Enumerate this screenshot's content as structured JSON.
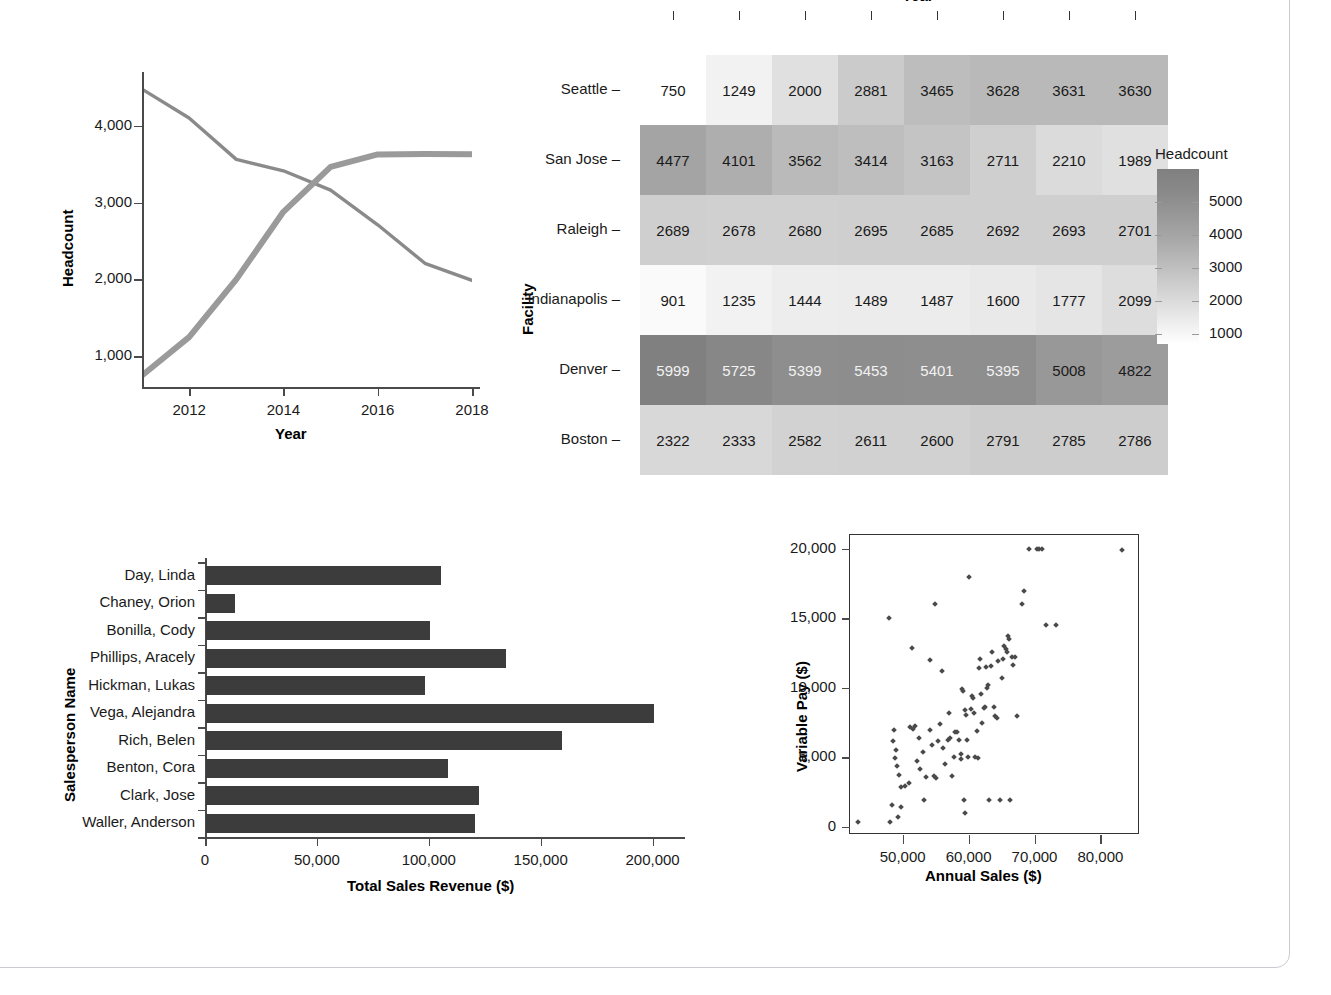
{
  "chart_data": [
    {
      "type": "line",
      "name": "headcount-trend",
      "title": "",
      "xlabel": "Year",
      "ylabel": "Headcount",
      "x": [
        2011,
        2012,
        2013,
        2014,
        2015,
        2016,
        2017,
        2018
      ],
      "xticks": [
        2012,
        2014,
        2016,
        2018
      ],
      "yticks": [
        1000,
        2000,
        3000,
        4000
      ],
      "yticklabels": [
        "1,000",
        "2,000",
        "3,000",
        "4,000"
      ],
      "xlim": [
        2011,
        2018
      ],
      "ylim": [
        600,
        4700
      ],
      "grid": false,
      "legend": "none",
      "series": [
        {
          "name": "San Jose",
          "values": [
            4477,
            4101,
            3562,
            3414,
            3163,
            2711,
            2210,
            1989
          ],
          "color": "#8a8a8a"
        },
        {
          "name": "Seattle",
          "values": [
            750,
            1249,
            2000,
            2881,
            3465,
            3628,
            3631,
            3630
          ],
          "color": "#9a9a9a"
        }
      ]
    },
    {
      "type": "heatmap",
      "name": "facility-headcount-heatmap",
      "title": "",
      "xlabel": "Year",
      "ylabel": "Facility",
      "categories": [
        "2011",
        "2012",
        "2013",
        "2014",
        "2015",
        "2016",
        "2017",
        "2018"
      ],
      "rows": [
        "Seattle",
        "San Jose",
        "Raleigh",
        "Indianapolis",
        "Denver",
        "Boston"
      ],
      "values": [
        [
          750,
          1249,
          2000,
          2881,
          3465,
          3628,
          3631,
          3630
        ],
        [
          4477,
          4101,
          3562,
          3414,
          3163,
          2711,
          2210,
          1989
        ],
        [
          2689,
          2678,
          2680,
          2695,
          2685,
          2692,
          2693,
          2701
        ],
        [
          901,
          1235,
          1444,
          1489,
          1487,
          1600,
          1777,
          2099
        ],
        [
          5999,
          5725,
          5399,
          5453,
          5401,
          5395,
          5008,
          4822
        ],
        [
          2322,
          2333,
          2582,
          2611,
          2600,
          2791,
          2785,
          2786
        ]
      ],
      "colorbar": {
        "title": "Headcount",
        "ticks": [
          5000,
          4000,
          3000,
          2000,
          1000
        ],
        "ticklabels": [
          "5000",
          "4000",
          "3000",
          "2000",
          "1000"
        ],
        "vmin": 700,
        "vmax": 6000,
        "low_color": "#ffffff",
        "high_color": "#808080"
      }
    },
    {
      "type": "bar",
      "name": "sales-by-person",
      "orientation": "horizontal",
      "title": "",
      "xlabel": "Total Sales Revenue ($)",
      "ylabel": "Salesperson Name",
      "categories": [
        "Day, Linda",
        "Chaney, Orion",
        "Bonilla, Cody",
        "Phillips, Aracely",
        "Hickman, Lukas",
        "Vega, Alejandra",
        "Rich, Belen",
        "Benton, Cora",
        "Clark, Jose",
        "Waller, Anderson"
      ],
      "values": [
        105000,
        13000,
        100000,
        134000,
        98000,
        200000,
        159000,
        108000,
        122000,
        120000
      ],
      "xticks": [
        0,
        50000,
        100000,
        150000,
        200000
      ],
      "xticklabels": [
        "0",
        "50,000",
        "100,000",
        "150,000",
        "200,000"
      ],
      "xlim": [
        0,
        210000
      ],
      "bar_color": "#3c3c3c",
      "grid": false
    },
    {
      "type": "scatter",
      "name": "pay-vs-sales",
      "title": "",
      "xlabel": "Annual Sales ($)",
      "ylabel": "Variable Pay ($)",
      "xticks": [
        50000,
        60000,
        70000,
        80000
      ],
      "xticklabels": [
        "50,000",
        "60,000",
        "70,000",
        "80,000"
      ],
      "yticks": [
        0,
        5000,
        10000,
        15000,
        20000
      ],
      "yticklabels": [
        "0",
        "5,000",
        "10,000",
        "15,000",
        "20,000"
      ],
      "xlim": [
        42000,
        86000
      ],
      "ylim": [
        -600,
        21000
      ],
      "marker_color": "#4a4a4a",
      "points": [
        [
          43200,
          330
        ],
        [
          48100,
          350
        ],
        [
          48400,
          1550
        ],
        [
          49300,
          700
        ],
        [
          49700,
          1450
        ],
        [
          47900,
          15000
        ],
        [
          48600,
          6950
        ],
        [
          48500,
          6150
        ],
        [
          48900,
          4950
        ],
        [
          49000,
          5550
        ],
        [
          49200,
          4350
        ],
        [
          49500,
          3750
        ],
        [
          49800,
          2850
        ],
        [
          50400,
          2900
        ],
        [
          50900,
          3150
        ],
        [
          51100,
          7150
        ],
        [
          51600,
          7050
        ],
        [
          51900,
          7250
        ],
        [
          51400,
          12900
        ],
        [
          52100,
          4750
        ],
        [
          52600,
          4150
        ],
        [
          52400,
          6350
        ],
        [
          53000,
          5400
        ],
        [
          53300,
          1900
        ],
        [
          53600,
          3600
        ],
        [
          54100,
          12000
        ],
        [
          54200,
          6950
        ],
        [
          54500,
          5900
        ],
        [
          54800,
          3650
        ],
        [
          55100,
          3500
        ],
        [
          55300,
          6200
        ],
        [
          55600,
          7400
        ],
        [
          55900,
          11200
        ],
        [
          54900,
          16000
        ],
        [
          56100,
          5700
        ],
        [
          56400,
          4500
        ],
        [
          56800,
          6250
        ],
        [
          57000,
          8150
        ],
        [
          57200,
          6350
        ],
        [
          57500,
          3650
        ],
        [
          57800,
          5050
        ],
        [
          58000,
          6850
        ],
        [
          58200,
          6850
        ],
        [
          58500,
          6250
        ],
        [
          58800,
          5200
        ],
        [
          58900,
          4900
        ],
        [
          59000,
          9900
        ],
        [
          59100,
          9750
        ],
        [
          59300,
          1900
        ],
        [
          59400,
          8400
        ],
        [
          59600,
          8050
        ],
        [
          59700,
          6250
        ],
        [
          59900,
          5050
        ],
        [
          59500,
          1000
        ],
        [
          60100,
          18000
        ],
        [
          60300,
          8500
        ],
        [
          60500,
          9400
        ],
        [
          60600,
          9250
        ],
        [
          60800,
          8200
        ],
        [
          61000,
          5050
        ],
        [
          61200,
          6900
        ],
        [
          61400,
          4950
        ],
        [
          61600,
          11400
        ],
        [
          61700,
          12100
        ],
        [
          61900,
          9550
        ],
        [
          62000,
          7500
        ],
        [
          62300,
          8550
        ],
        [
          62500,
          8600
        ],
        [
          62700,
          11500
        ],
        [
          62900,
          10200
        ],
        [
          62800,
          10000
        ],
        [
          63100,
          1900
        ],
        [
          63400,
          11600
        ],
        [
          63600,
          12600
        ],
        [
          63800,
          8600
        ],
        [
          64000,
          7950
        ],
        [
          64300,
          7800
        ],
        [
          64500,
          11900
        ],
        [
          64700,
          1900
        ],
        [
          65000,
          10700
        ],
        [
          65200,
          12100
        ],
        [
          65400,
          13000
        ],
        [
          65600,
          12800
        ],
        [
          65800,
          12600
        ],
        [
          66000,
          13700
        ],
        [
          66100,
          13500
        ],
        [
          66300,
          1900
        ],
        [
          66600,
          12200
        ],
        [
          66800,
          11650
        ],
        [
          67000,
          12200
        ],
        [
          67400,
          8000
        ],
        [
          68100,
          16000
        ],
        [
          68400,
          17000
        ],
        [
          69100,
          20000
        ],
        [
          70400,
          20000
        ],
        [
          70700,
          20000
        ],
        [
          71800,
          14500
        ],
        [
          73300,
          14500
        ],
        [
          83200,
          19900
        ],
        [
          71200,
          20000
        ]
      ]
    }
  ]
}
